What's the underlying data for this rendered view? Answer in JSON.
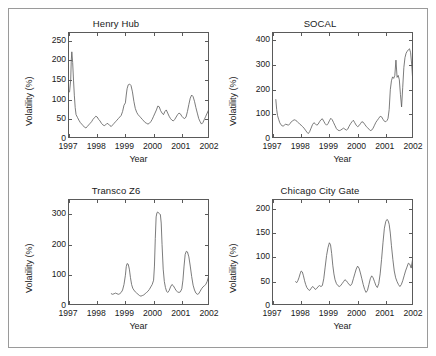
{
  "figure": {
    "background": "#ffffff",
    "frame_color": "#9a9a9a",
    "line_color": "#5a5a5a",
    "text_color": "#1a1a1a"
  },
  "chart_data": [
    {
      "type": "line",
      "title": "Henry Hub",
      "xlabel": "Year",
      "ylabel": "Volatility (%)",
      "xlim": [
        1997.0,
        2002.0
      ],
      "ylim": [
        0,
        270
      ],
      "xticks": [
        1997,
        1998,
        1999,
        2000,
        2001,
        2002
      ],
      "xticklabels": [
        "1997",
        "1998",
        "1999",
        "2000",
        "2001",
        "2002"
      ],
      "yticks": [
        0,
        50,
        100,
        150,
        200,
        250
      ],
      "yticklabels": [
        "0",
        "50",
        "100",
        "150",
        "200",
        "250"
      ],
      "grid": false,
      "legend": null,
      "series": [
        {
          "name": "Henry Hub volatility",
          "x": [
            1997.02,
            1997.06,
            1997.08,
            1997.1,
            1997.13,
            1997.16,
            1997.19,
            1997.22,
            1997.25,
            1997.3,
            1997.35,
            1997.4,
            1997.45,
            1997.5,
            1997.55,
            1997.6,
            1997.65,
            1997.7,
            1997.75,
            1997.8,
            1997.85,
            1997.9,
            1997.95,
            1998.0,
            1998.05,
            1998.1,
            1998.15,
            1998.2,
            1998.25,
            1998.3,
            1998.35,
            1998.4,
            1998.45,
            1998.5,
            1998.55,
            1998.6,
            1998.65,
            1998.7,
            1998.75,
            1998.8,
            1998.85,
            1998.9,
            1998.95,
            1999.0,
            1999.03,
            1999.06,
            1999.1,
            1999.15,
            1999.2,
            1999.25,
            1999.3,
            1999.35,
            1999.4,
            1999.45,
            1999.5,
            1999.55,
            1999.6,
            1999.65,
            1999.7,
            1999.75,
            1999.8,
            1999.85,
            1999.9,
            1999.95,
            2000.0,
            2000.05,
            2000.1,
            2000.15,
            2000.2,
            2000.25,
            2000.3,
            2000.35,
            2000.4,
            2000.45,
            2000.5,
            2000.55,
            2000.6,
            2000.65,
            2000.7,
            2000.75,
            2000.8,
            2000.85,
            2000.9,
            2000.95,
            2001.0,
            2001.05,
            2001.1,
            2001.15,
            2001.2,
            2001.25,
            2001.3,
            2001.35,
            2001.4,
            2001.45,
            2001.5,
            2001.55,
            2001.6,
            2001.65,
            2001.7,
            2001.75,
            2001.8,
            2001.85,
            2001.9,
            2001.95,
            2002.0
          ],
          "y": [
            120,
            150,
            200,
            222,
            195,
            150,
            110,
            80,
            62,
            55,
            48,
            42,
            38,
            34,
            30,
            28,
            32,
            36,
            40,
            44,
            50,
            54,
            58,
            56,
            50,
            46,
            40,
            36,
            34,
            36,
            40,
            38,
            34,
            32,
            36,
            40,
            44,
            48,
            52,
            56,
            60,
            70,
            86,
            92,
            112,
            128,
            138,
            140,
            136,
            120,
            96,
            78,
            68,
            62,
            58,
            54,
            50,
            46,
            42,
            40,
            38,
            40,
            44,
            50,
            58,
            66,
            74,
            84,
            82,
            72,
            66,
            62,
            70,
            74,
            66,
            58,
            52,
            48,
            46,
            50,
            56,
            62,
            66,
            64,
            58,
            54,
            52,
            56,
            70,
            88,
            104,
            112,
            108,
            96,
            80,
            66,
            52,
            44,
            38,
            42,
            50,
            58,
            66,
            74,
            86,
            112,
            148
          ]
        }
      ]
    },
    {
      "type": "line",
      "title": "SOCAL",
      "xlabel": "Year",
      "ylabel": "Volatility (%)",
      "xlim": [
        1997.0,
        2002.0
      ],
      "ylim": [
        0,
        430
      ],
      "xticks": [
        1997,
        1998,
        1999,
        2000,
        2001,
        2002
      ],
      "xticklabels": [
        "1997",
        "1998",
        "1999",
        "2000",
        "2001",
        "2002"
      ],
      "yticks": [
        0,
        100,
        200,
        300,
        400
      ],
      "yticklabels": [
        "0",
        "100",
        "200",
        "300",
        "400"
      ],
      "grid": false,
      "legend": null,
      "series": [
        {
          "name": "SOCAL volatility",
          "x": [
            1997.1,
            1997.13,
            1997.16,
            1997.2,
            1997.24,
            1997.28,
            1997.32,
            1997.36,
            1997.4,
            1997.45,
            1997.5,
            1997.55,
            1997.6,
            1997.65,
            1997.7,
            1997.75,
            1997.8,
            1997.85,
            1997.9,
            1997.95,
            1998.0,
            1998.05,
            1998.1,
            1998.15,
            1998.2,
            1998.25,
            1998.3,
            1998.35,
            1998.4,
            1998.45,
            1998.5,
            1998.55,
            1998.6,
            1998.65,
            1998.7,
            1998.75,
            1998.8,
            1998.85,
            1998.9,
            1998.95,
            1999.0,
            1999.05,
            1999.1,
            1999.15,
            1999.2,
            1999.25,
            1999.3,
            1999.35,
            1999.4,
            1999.45,
            1999.5,
            1999.55,
            1999.6,
            1999.65,
            1999.7,
            1999.75,
            1999.8,
            1999.85,
            1999.9,
            1999.95,
            2000.0,
            2000.05,
            2000.1,
            2000.15,
            2000.2,
            2000.25,
            2000.3,
            2000.35,
            2000.4,
            2000.45,
            2000.5,
            2000.55,
            2000.6,
            2000.65,
            2000.7,
            2000.75,
            2000.8,
            2000.85,
            2000.9,
            2000.95,
            2001.0,
            2001.05,
            2001.08,
            2001.12,
            2001.16,
            2001.2,
            2001.24,
            2001.28,
            2001.32,
            2001.36,
            2001.4,
            2001.44,
            2001.48,
            2001.52,
            2001.56,
            2001.6,
            2001.64,
            2001.68,
            2001.72,
            2001.76,
            2001.8,
            2001.84,
            2001.88,
            2001.92,
            2001.96,
            2002.0
          ],
          "y": [
            160,
            120,
            96,
            80,
            66,
            58,
            54,
            52,
            56,
            60,
            58,
            56,
            62,
            70,
            74,
            78,
            76,
            72,
            66,
            60,
            56,
            50,
            44,
            36,
            28,
            22,
            30,
            44,
            58,
            66,
            62,
            56,
            60,
            70,
            78,
            82,
            72,
            62,
            56,
            62,
            74,
            84,
            78,
            66,
            54,
            42,
            36,
            34,
            36,
            40,
            44,
            40,
            36,
            40,
            52,
            62,
            70,
            76,
            66,
            56,
            50,
            54,
            62,
            70,
            68,
            60,
            52,
            46,
            40,
            34,
            36,
            44,
            56,
            68,
            76,
            84,
            92,
            90,
            80,
            72,
            70,
            76,
            84,
            120,
            200,
            236,
            252,
            246,
            258,
            320,
            250,
            258,
            240,
            180,
            130,
            210,
            290,
            330,
            348,
            356,
            362,
            366,
            350,
            300,
            230,
            160
          ]
        }
      ]
    },
    {
      "type": "line",
      "title": "Transco Z6",
      "xlabel": "Year",
      "ylabel": "Volatility (%)",
      "xlim": [
        1997.0,
        2002.0
      ],
      "ylim": [
        0,
        345
      ],
      "xticks": [
        1997,
        1998,
        1999,
        2000,
        2001,
        2002
      ],
      "xticklabels": [
        "1997",
        "1998",
        "1999",
        "2000",
        "2001",
        "2002"
      ],
      "yticks": [
        0,
        100,
        200,
        300
      ],
      "yticklabels": [
        "0",
        "100",
        "200",
        "300"
      ],
      "grid": false,
      "legend": null,
      "series": [
        {
          "name": "Transco Z6 volatility",
          "x": [
            1998.5,
            1998.55,
            1998.6,
            1998.65,
            1998.7,
            1998.75,
            1998.8,
            1998.85,
            1998.9,
            1998.95,
            1999.0,
            1999.03,
            1999.06,
            1999.1,
            1999.14,
            1999.18,
            1999.22,
            1999.26,
            1999.3,
            1999.35,
            1999.4,
            1999.45,
            1999.5,
            1999.55,
            1999.6,
            1999.65,
            1999.7,
            1999.75,
            1999.8,
            1999.85,
            1999.9,
            1999.95,
            2000.0,
            2000.03,
            2000.06,
            2000.09,
            2000.12,
            2000.15,
            2000.18,
            2000.21,
            2000.24,
            2000.27,
            2000.3,
            2000.34,
            2000.38,
            2000.42,
            2000.46,
            2000.5,
            2000.55,
            2000.6,
            2000.65,
            2000.7,
            2000.75,
            2000.8,
            2000.85,
            2000.9,
            2000.95,
            2001.0,
            2001.04,
            2001.08,
            2001.12,
            2001.16,
            2001.2,
            2001.25,
            2001.3,
            2001.35,
            2001.4,
            2001.45,
            2001.5,
            2001.55,
            2001.6,
            2001.65,
            2001.7,
            2001.75,
            2001.8,
            2001.85,
            2001.9,
            2001.95,
            2002.0
          ],
          "y": [
            40,
            38,
            40,
            42,
            40,
            38,
            40,
            44,
            52,
            70,
            100,
            128,
            138,
            136,
            120,
            92,
            70,
            58,
            52,
            46,
            42,
            38,
            34,
            32,
            34,
            36,
            40,
            44,
            48,
            54,
            62,
            70,
            84,
            130,
            220,
            290,
            304,
            306,
            302,
            300,
            298,
            270,
            200,
            120,
            80,
            60,
            48,
            44,
            50,
            62,
            70,
            66,
            58,
            50,
            46,
            44,
            46,
            56,
            84,
            130,
            168,
            178,
            176,
            160,
            130,
            96,
            68,
            52,
            42,
            38,
            40,
            48,
            56,
            62,
            66,
            70,
            80,
            96,
            170
          ]
        }
      ]
    },
    {
      "type": "line",
      "title": "Chicago City Gate",
      "xlabel": "Year",
      "ylabel": "Volatility (%)",
      "xlim": [
        1997.0,
        2002.0
      ],
      "ylim": [
        0,
        218
      ],
      "xticks": [
        1997,
        1998,
        1999,
        2000,
        2001,
        2002
      ],
      "xticklabels": [
        "1997",
        "1998",
        "1999",
        "2000",
        "2001",
        "2002"
      ],
      "yticks": [
        0,
        50,
        100,
        150,
        200
      ],
      "yticklabels": [
        "0",
        "50",
        "100",
        "150",
        "200"
      ],
      "grid": false,
      "legend": null,
      "series": [
        {
          "name": "Chicago City Gate volatility",
          "x": [
            1997.8,
            1997.84,
            1997.88,
            1997.92,
            1997.96,
            1998.0,
            1998.04,
            1998.08,
            1998.12,
            1998.16,
            1998.2,
            1998.25,
            1998.3,
            1998.35,
            1998.4,
            1998.45,
            1998.5,
            1998.55,
            1998.6,
            1998.65,
            1998.7,
            1998.75,
            1998.8,
            1998.85,
            1998.9,
            1998.95,
            1999.0,
            1999.04,
            1999.08,
            1999.12,
            1999.16,
            1999.2,
            1999.25,
            1999.3,
            1999.35,
            1999.4,
            1999.45,
            1999.5,
            1999.55,
            1999.6,
            1999.65,
            1999.7,
            1999.75,
            1999.8,
            1999.85,
            1999.9,
            1999.95,
            2000.0,
            2000.05,
            2000.1,
            2000.15,
            2000.2,
            2000.25,
            2000.3,
            2000.35,
            2000.4,
            2000.45,
            2000.5,
            2000.55,
            2000.6,
            2000.65,
            2000.7,
            2000.75,
            2000.8,
            2000.85,
            2000.9,
            2000.95,
            2001.0,
            2001.04,
            2001.08,
            2001.12,
            2001.16,
            2001.2,
            2001.25,
            2001.3,
            2001.35,
            2001.4,
            2001.45,
            2001.5,
            2001.55,
            2001.6,
            2001.65,
            2001.7,
            2001.75,
            2001.8,
            2001.85,
            2001.9,
            2001.95,
            2002.0
          ],
          "y": [
            50,
            48,
            52,
            58,
            66,
            72,
            70,
            62,
            52,
            44,
            38,
            34,
            32,
            36,
            40,
            38,
            34,
            36,
            40,
            42,
            40,
            42,
            56,
            80,
            104,
            120,
            130,
            126,
            108,
            84,
            66,
            54,
            46,
            42,
            40,
            42,
            46,
            50,
            54,
            52,
            48,
            44,
            42,
            46,
            56,
            66,
            76,
            82,
            78,
            68,
            56,
            44,
            34,
            28,
            32,
            44,
            56,
            62,
            58,
            50,
            42,
            38,
            46,
            66,
            96,
            130,
            160,
            174,
            178,
            176,
            168,
            150,
            124,
            96,
            72,
            58,
            50,
            44,
            40,
            44,
            52,
            62,
            72,
            80,
            88,
            86,
            78,
            96,
            138
          ]
        }
      ]
    }
  ]
}
